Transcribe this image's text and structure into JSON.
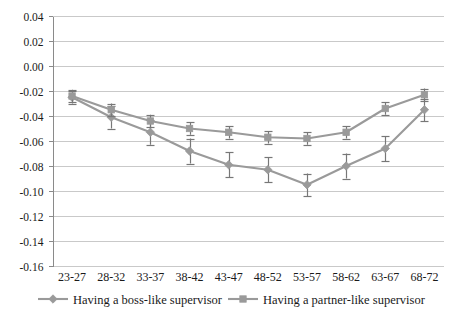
{
  "chart_data": {
    "type": "line",
    "title": "",
    "subtitle": "",
    "xlabel": "",
    "ylabel": "",
    "categories": [
      "23-27",
      "28-32",
      "33-37",
      "38-42",
      "43-47",
      "48-52",
      "53-57",
      "58-62",
      "63-67",
      "68-72"
    ],
    "ylim": [
      -0.16,
      0.04
    ],
    "ytick_labels": [
      "0.04",
      "0.02",
      "0.00",
      "-0.02",
      "-0.04",
      "-0.06",
      "-0.08",
      "-0.10",
      "-0.12",
      "-0.14",
      "-0.16"
    ],
    "ytick_values": [
      0.04,
      0.02,
      0.0,
      -0.02,
      -0.04,
      -0.06,
      -0.08,
      -0.1,
      -0.12,
      -0.14,
      -0.16
    ],
    "grid": true,
    "legend_position": "bottom",
    "series": [
      {
        "name": "Having a boss-like supervisor",
        "marker": "diamond",
        "color": "#9a9a9a",
        "values": [
          -0.025,
          -0.041,
          -0.053,
          -0.068,
          -0.079,
          -0.083,
          -0.095,
          -0.08,
          -0.066,
          -0.035
        ],
        "errors": [
          0.005,
          0.009,
          0.01,
          0.01,
          0.01,
          0.01,
          0.009,
          0.01,
          0.01,
          0.009
        ]
      },
      {
        "name": "Having a partner-like supervisor",
        "marker": "square",
        "color": "#9a9a9a",
        "values": [
          -0.024,
          -0.035,
          -0.044,
          -0.05,
          -0.053,
          -0.057,
          -0.058,
          -0.053,
          -0.034,
          -0.023
        ],
        "errors": [
          0.005,
          0.005,
          0.005,
          0.005,
          0.005,
          0.005,
          0.005,
          0.005,
          0.005,
          0.005
        ]
      }
    ]
  },
  "legend": {
    "items": [
      {
        "label": "Having a boss-like supervisor",
        "marker": "diamond",
        "color": "#9a9a9a"
      },
      {
        "label": "Having a partner-like supervisor",
        "marker": "square",
        "color": "#9a9a9a"
      }
    ]
  },
  "colors": {
    "series_gray": "#9a9a9a",
    "gridline": "#c9c9c9",
    "axis": "#8a8a8a",
    "text": "#1a1a1a",
    "background": "#ffffff"
  }
}
